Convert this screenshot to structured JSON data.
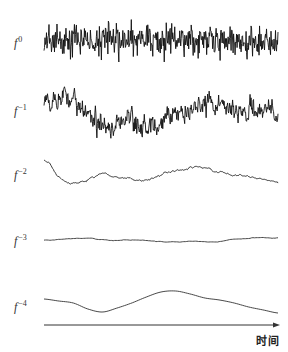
{
  "figure": {
    "axis": {
      "label": "时间",
      "x_start": 44,
      "x_end": 280,
      "y": 325,
      "color": "#333333"
    },
    "traces": [
      {
        "id": "f0",
        "label_base": "f",
        "label_exp": "0",
        "label_x": 14,
        "label_y": 36,
        "center_y": 40,
        "amplitude": 22,
        "smoothness": 0,
        "points": 470,
        "color": "#111111",
        "width": 0.9,
        "anchors": [
          0,
          0,
          0,
          0,
          0,
          0
        ]
      },
      {
        "id": "f-1",
        "label_base": "f",
        "label_exp": "−1",
        "label_x": 14,
        "label_y": 104,
        "center_y": 112,
        "amplitude": 18,
        "smoothness": 1,
        "points": 470,
        "color": "#111111",
        "width": 0.9,
        "anchors": [
          6,
          14,
          0,
          -14,
          -10,
          -16,
          -6,
          4,
          10,
          0,
          2,
          -4
        ]
      },
      {
        "id": "f-2",
        "label_base": "f",
        "label_exp": "−2",
        "label_x": 14,
        "label_y": 168,
        "center_y": 174,
        "amplitude": 3,
        "smoothness": 2,
        "points": 300,
        "color": "#222222",
        "width": 0.9,
        "anchors": [
          14,
          -6,
          -8,
          0,
          -4,
          -6,
          -2,
          4,
          6,
          2,
          -2,
          -4,
          -8
        ]
      },
      {
        "id": "f-3",
        "label_base": "f",
        "label_exp": "−3",
        "label_x": 14,
        "label_y": 234,
        "center_y": 240,
        "amplitude": 0.6,
        "smoothness": 3,
        "points": 160,
        "color": "#333333",
        "width": 0.9,
        "anchors": [
          0,
          1,
          2,
          0,
          0,
          -1,
          -2,
          -1,
          -2,
          1,
          2,
          2
        ]
      },
      {
        "id": "f-4",
        "label_base": "f",
        "label_exp": "−4",
        "label_x": 14,
        "label_y": 300,
        "center_y": 303,
        "amplitude": 0,
        "smoothness": 4,
        "points": 120,
        "color": "#333333",
        "width": 0.9,
        "anchors": [
          4,
          2,
          0,
          -6,
          -9,
          -5,
          0,
          6,
          11,
          12,
          9,
          5,
          3,
          0,
          -4,
          -7,
          -10
        ]
      }
    ]
  }
}
